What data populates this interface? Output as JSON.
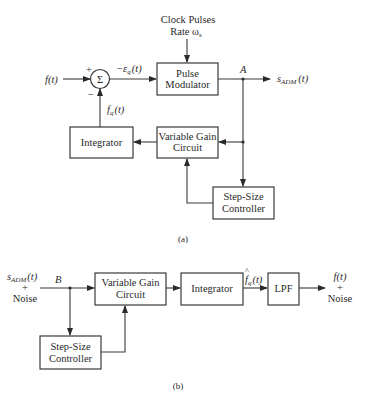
{
  "diagram_a": {
    "caption": "(a)",
    "clock": {
      "line1": "Clock Pulses",
      "line2": "Rate ω",
      "line2_sub": "s"
    },
    "input_label": "f(t)",
    "sum_symbol": "Σ",
    "plus_sign": "+",
    "minus_sign": "−",
    "error_label": "−ε",
    "error_sub": "q",
    "error_arg": "(t)",
    "feedback_label": "f",
    "feedback_sub": "q",
    "feedback_arg": "(t)",
    "node_label": "A",
    "output_label": "s",
    "output_sub": "ADM",
    "output_arg": "(t)",
    "blocks": {
      "pulse_modulator": {
        "line1": "Pulse",
        "line2": "Modulator"
      },
      "integrator": {
        "line1": "Integrator"
      },
      "variable_gain": {
        "line1": "Variable Gain",
        "line2": "Circuit"
      },
      "step_size": {
        "line1": "Step-Size",
        "line2": "Controller"
      }
    }
  },
  "diagram_b": {
    "caption": "(b)",
    "input_label": "s",
    "input_sub": "ADM",
    "input_arg": "(t)",
    "input_plus": "+",
    "input_noise": "Noise",
    "node_label": "B",
    "mid_label": "f",
    "mid_hat": "^",
    "mid_sub": "q",
    "mid_arg": "(t)",
    "output_label": "f(t)",
    "output_plus": "+",
    "output_noise": "Noise",
    "blocks": {
      "variable_gain": {
        "line1": "Variable Gain",
        "line2": "Circuit"
      },
      "integrator": {
        "line1": "Integrator"
      },
      "lpf": {
        "line1": "LPF"
      },
      "step_size": {
        "line1": "Step-Size",
        "line2": "Controller"
      }
    }
  }
}
